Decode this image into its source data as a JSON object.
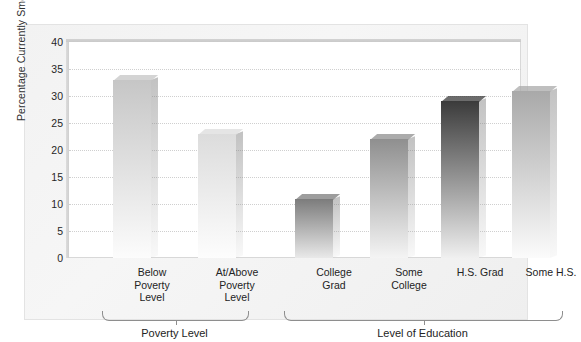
{
  "chart_data": {
    "type": "bar",
    "title": "",
    "xlabel": "",
    "ylabel": "Percentage Currently Smoking",
    "ylim": [
      0,
      40
    ],
    "ytick_step": 5,
    "yticks": [
      "40",
      "35",
      "30",
      "25",
      "20",
      "15",
      "10",
      "5",
      "0"
    ],
    "grid": true,
    "legend": "none",
    "categories": [
      "Below\nPoverty\nLevel",
      "At/Above\nPoverty\nLevel",
      "College\nGrad",
      "Some\nCollege",
      "H.S. Grad",
      "Some H.S."
    ],
    "values": [
      33,
      23,
      11,
      22,
      29,
      31
    ],
    "groups": [
      {
        "label": "Poverty Level",
        "members": [
          "Below Poverty Level",
          "At/Above Poverty Level"
        ]
      },
      {
        "label": "Level of Education",
        "members": [
          "College Grad",
          "Some College",
          "H.S. Grad",
          "Some H.S."
        ]
      }
    ]
  },
  "bars": [
    {
      "id": "bar-below-poverty-level",
      "value": 33,
      "label_lines": [
        "Below",
        "Poverty",
        "Level"
      ],
      "shade_top": "#c6c6c6",
      "shade_bottom": "#fcfcfc"
    },
    {
      "id": "bar-at-above-poverty-level",
      "value": 23,
      "label_lines": [
        "At/Above",
        "Poverty",
        "Level"
      ],
      "shade_top": "#dcdcdc",
      "shade_bottom": "#fdfdfd"
    },
    {
      "id": "bar-college-grad",
      "value": 11,
      "label_lines": [
        "College",
        "Grad"
      ],
      "shade_top": "#7c7c7c",
      "shade_bottom": "#e9e9e9"
    },
    {
      "id": "bar-some-college",
      "value": 22,
      "label_lines": [
        "Some",
        "College"
      ],
      "shade_top": "#8f8f8f",
      "shade_bottom": "#f4f4f4"
    },
    {
      "id": "bar-hs-grad",
      "value": 29,
      "label_lines": [
        "H.S. Grad"
      ],
      "shade_top": "#3b3b3b",
      "shade_bottom": "#f0f0f0"
    },
    {
      "id": "bar-some-hs",
      "value": 31,
      "label_lines": [
        "Some H.S."
      ],
      "shade_top": "#a9a9a9",
      "shade_bottom": "#fbfbfb"
    }
  ],
  "axis": {
    "y_title": "Percentage Currently Smoking",
    "y_ticks": [
      "40",
      "35",
      "30",
      "25",
      "20",
      "15",
      "10",
      "5",
      "0"
    ]
  },
  "groups": [
    {
      "id": "group-poverty-level",
      "label": "Poverty Level"
    },
    {
      "id": "group-level-of-education",
      "label": "Level of Education"
    }
  ],
  "colors": {
    "panel": "#f3f3f3",
    "plot_bg": "#ffffff",
    "grid": "#cfcfcf",
    "text": "#232323",
    "bracket": "#8e8e8e"
  }
}
